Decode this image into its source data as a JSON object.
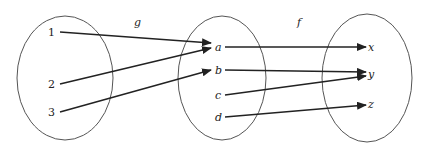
{
  "diagram": {
    "type": "function-composition-mapping",
    "functions": [
      {
        "name": "g",
        "label": "g"
      },
      {
        "name": "f",
        "label": "f"
      }
    ],
    "sets": [
      {
        "id": "domain",
        "elements": [
          "1",
          "2",
          "3"
        ]
      },
      {
        "id": "middle",
        "elements": [
          "a",
          "b",
          "c",
          "d"
        ]
      },
      {
        "id": "codomain",
        "elements": [
          "x",
          "y",
          "z"
        ]
      }
    ],
    "mappings": {
      "g": [
        {
          "from": "1",
          "to": "a"
        },
        {
          "from": "2",
          "to": "a"
        },
        {
          "from": "3",
          "to": "b"
        }
      ],
      "f": [
        {
          "from": "a",
          "to": "x"
        },
        {
          "from": "b",
          "to": "y"
        },
        {
          "from": "c",
          "to": "y"
        },
        {
          "from": "d",
          "to": "z"
        }
      ]
    },
    "colors": {
      "stroke": "#222222",
      "ellipse": "#555555"
    }
  },
  "labels": {
    "g": "g",
    "f": "f",
    "e1": "1",
    "e2": "2",
    "e3": "3",
    "ea": "a",
    "eb": "b",
    "ec": "c",
    "ed": "d",
    "ex": "x",
    "ey": "y",
    "ez": "z"
  }
}
